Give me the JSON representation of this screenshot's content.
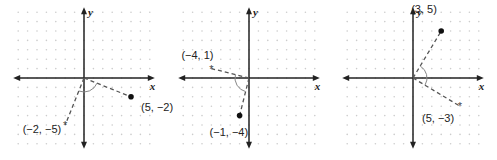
{
  "panels": [
    {
      "id": "panel-1",
      "origin": [
        84,
        78
      ],
      "axis_labels": {
        "x": "x",
        "y": "y"
      },
      "point_original": {
        "coords": [
          5,
          -2
        ],
        "label": "(5, −2)",
        "marker": "dot"
      },
      "point_rotated": {
        "coords": [
          -2,
          -5
        ],
        "label": "(−2, −5)",
        "marker": "star"
      }
    },
    {
      "id": "panel-2",
      "origin": [
        249,
        78
      ],
      "axis_labels": {
        "x": "x",
        "y": "y"
      },
      "point_original": {
        "coords": [
          -1,
          -4
        ],
        "label": "(−1, −4)",
        "marker": "dot"
      },
      "point_rotated": {
        "coords": [
          -4,
          1
        ],
        "label": "(−4, 1)",
        "marker": "star"
      }
    },
    {
      "id": "panel-3",
      "origin": [
        413,
        78
      ],
      "axis_labels": {
        "x": "x",
        "y": "y"
      },
      "point_original": {
        "coords": [
          3,
          5
        ],
        "label": "(3, 5)",
        "marker": "dot"
      },
      "point_rotated": {
        "coords": [
          5,
          -3
        ],
        "label": "(5, −3)",
        "marker": "star"
      }
    }
  ],
  "grid": {
    "spacing": 9.4,
    "range": 7
  },
  "colors": {
    "axis": "#222222",
    "dots": "#cccccc",
    "dash": "#555555",
    "arc": "#888888"
  }
}
